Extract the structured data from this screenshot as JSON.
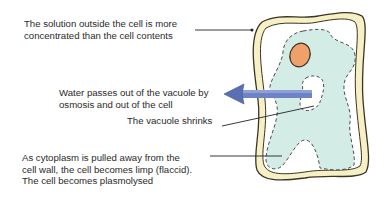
{
  "diagram": {
    "labels": {
      "solution": [
        "The solution outside the cell is more",
        "concentrated than the cell contents"
      ],
      "water": [
        "Water passes out of the vacuole by",
        "osmosis and out of the cell"
      ],
      "shrinks": [
        "The vacuole shrinks"
      ],
      "plasmolysed": [
        "As cytoplasm is pulled away from the",
        "cell wall, the cell becomes limp (flaccid).",
        "The cell becomes plasmolysed"
      ]
    },
    "parts": [
      "cell wall",
      "cytoplasm",
      "nucleus",
      "vacuole",
      "water arrow"
    ],
    "colors": {
      "cell_wall_fill": "#f6f0c4",
      "cell_wall_outline": "#3a3428",
      "cytoplasm": "#d3ece6",
      "nucleus": "#f0a16a",
      "arrow": "#5a6fb4",
      "leader_line": "#222222"
    }
  }
}
